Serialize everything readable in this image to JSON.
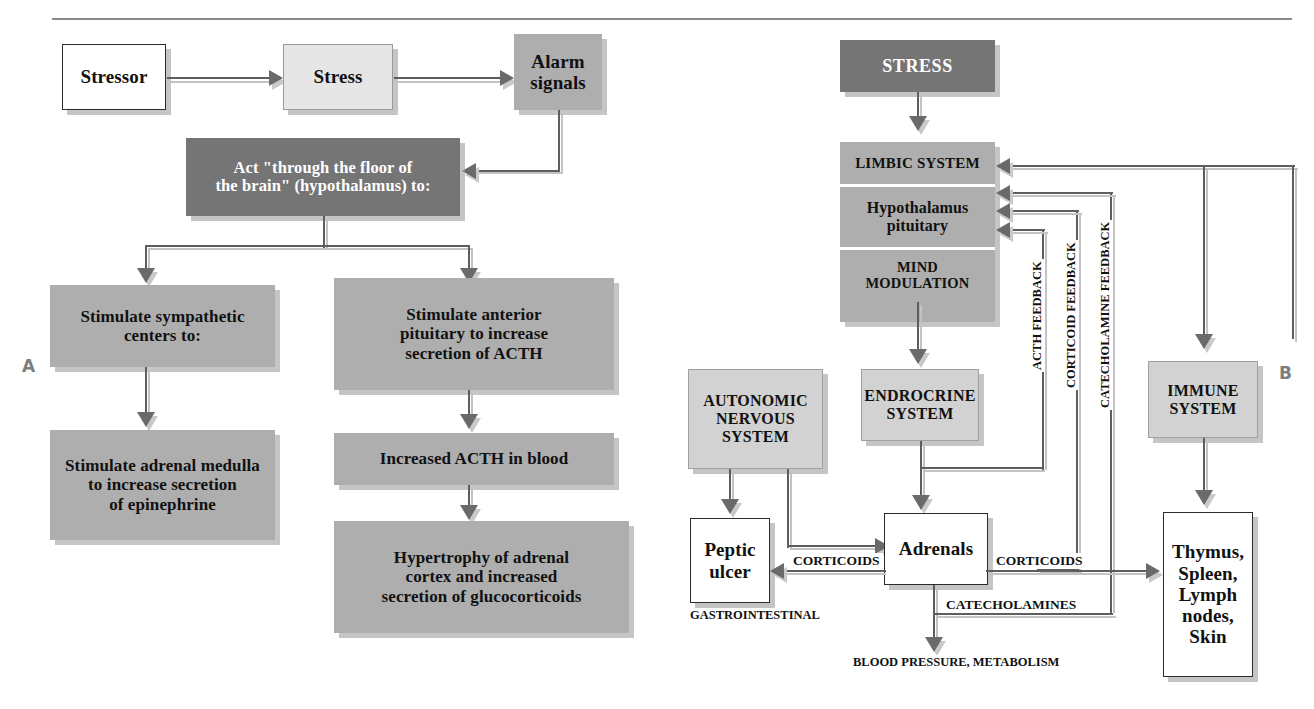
{
  "figure": {
    "panel_a_label": "A",
    "panel_b_label": "B"
  },
  "colors": {
    "box_white": "#ffffff",
    "box_light": "#e6e6e6",
    "box_light_gray": "#d2d2d2",
    "box_medium_gray": "#aeaeae",
    "box_dark_gray": "#757575",
    "line": "#5e5e5e",
    "shadow": "#c3c3c3",
    "panel_label": "#7d7d7d"
  },
  "panel_a": {
    "name": "Stress response cascade",
    "nodes": {
      "stressor": "Stressor",
      "stress": "Stress",
      "alarm_signals": "Alarm\nsignals",
      "hypothalamus": "Act \"through the floor of\nthe brain\" (hypothalamus) to:",
      "sympathetic": "Stimulate sympathetic\ncenters to:",
      "anterior_pituitary": "Stimulate anterior\npituitary to increase\nsecretion of ACTH",
      "adrenal_medulla": "Stimulate adrenal medulla\nto increase secretion\nof epinephrine",
      "acth_blood": "Increased ACTH in blood",
      "hypertrophy": "Hypertrophy of adrenal\ncortex and increased\nsecretion of glucocorticoids"
    }
  },
  "panel_b": {
    "name": "Mind modulation / immune feedback loops",
    "nodes": {
      "stress": "STRESS",
      "limbic_system": "LIMBIC SYSTEM",
      "hypothalamus_pituitary": "Hypothalamus\npituitary",
      "mind_modulation": "MIND MODULATION",
      "autonomic_nervous_system": "AUTONOMIC\nNERVOUS\nSYSTEM",
      "endocrine_system": "ENDROCRINE\nSYSTEM",
      "immune_system": "IMMUNE\nSYSTEM",
      "peptic_ulcer": "Peptic\nulcer",
      "adrenals": "Adrenals",
      "thymus": "Thymus,\nSpleen,\nLymph\nnodes,\nSkin"
    },
    "edge_labels": {
      "corticoids_left": "CORTICOIDS",
      "corticoids_right": "CORTICOIDS",
      "catecholamines": "CATECHOLAMINES",
      "gastrointestinal": "GASTROINTESTINAL",
      "blood_pressure": "BLOOD PRESSURE, METABOLISM"
    },
    "feedback_labels": {
      "acth": "ACTH FEEDBACK",
      "corticoid": "CORTICOID FEEDBACK",
      "catecholamine": "CATECHOLAMINE FEEDBACK"
    }
  }
}
